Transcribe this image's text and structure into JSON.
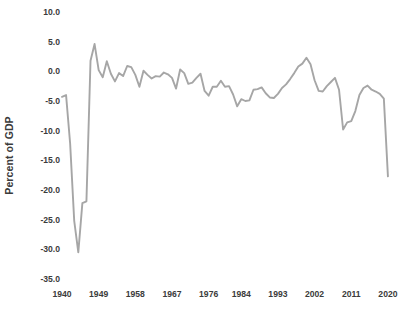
{
  "chart_data": {
    "type": "line",
    "title": "",
    "xlabel": "",
    "ylabel": "Percent of GDP",
    "ylim": [
      -35.0,
      10.0
    ],
    "xlim": [
      1940,
      2021
    ],
    "grid": false,
    "legend": "none",
    "line_color": "#a6a6a6",
    "y_ticks": [
      10.0,
      5.0,
      0.0,
      -5.0,
      -10.0,
      -15.0,
      -20.0,
      -25.0,
      -30.0,
      -35.0
    ],
    "y_tick_labels": [
      "10.0",
      "5.0",
      "0.0",
      "-5.0",
      "-10.0",
      "-15.0",
      "-20.0",
      "-25.0",
      "-30.0",
      "-35.0"
    ],
    "x_ticks": [
      1940,
      1949,
      1958,
      1967,
      1976,
      1984,
      1993,
      2002,
      2011,
      2020
    ],
    "x_tick_labels": [
      "1940",
      "1949",
      "1958",
      "1967",
      "1976",
      "1984",
      "1993",
      "2002",
      "2011",
      "2020"
    ],
    "x": [
      1940,
      1941,
      1942,
      1943,
      1944,
      1945,
      1946,
      1947,
      1948,
      1949,
      1950,
      1951,
      1952,
      1953,
      1954,
      1955,
      1956,
      1957,
      1958,
      1959,
      1960,
      1961,
      1962,
      1963,
      1964,
      1965,
      1966,
      1967,
      1968,
      1969,
      1970,
      1971,
      1972,
      1973,
      1974,
      1975,
      1976,
      1977,
      1978,
      1979,
      1980,
      1981,
      1982,
      1983,
      1984,
      1985,
      1986,
      1987,
      1988,
      1989,
      1990,
      1991,
      1992,
      1993,
      1994,
      1995,
      1996,
      1997,
      1998,
      1999,
      2000,
      2001,
      2002,
      2003,
      2004,
      2005,
      2006,
      2007,
      2008,
      2009,
      2010,
      2011,
      2012,
      2013,
      2014,
      2015,
      2016,
      2017,
      2018,
      2019,
      2020
    ],
    "values": [
      -4.3,
      -4.0,
      -12.2,
      -25.2,
      -30.5,
      -22.2,
      -21.9,
      1.8,
      4.6,
      0.2,
      -1.0,
      1.7,
      -0.4,
      -1.7,
      -0.3,
      -0.8,
      0.9,
      0.7,
      -0.6,
      -2.6,
      0.1,
      -0.6,
      -1.2,
      -0.8,
      -0.9,
      -0.2,
      -0.5,
      -1.1,
      -2.9,
      0.3,
      -0.3,
      -2.1,
      -1.9,
      -1.1,
      -0.4,
      -3.3,
      -4.1,
      -2.6,
      -2.6,
      -1.6,
      -2.6,
      -2.5,
      -3.9,
      -5.9,
      -4.7,
      -5.0,
      -4.9,
      -3.1,
      -3.0,
      -2.7,
      -3.7,
      -4.4,
      -4.5,
      -3.8,
      -2.8,
      -2.2,
      -1.3,
      -0.3,
      0.8,
      1.3,
      2.3,
      1.2,
      -1.5,
      -3.3,
      -3.4,
      -2.5,
      -1.8,
      -1.1,
      -3.1,
      -9.8,
      -8.6,
      -8.4,
      -6.7,
      -4.0,
      -2.8,
      -2.4,
      -3.1,
      -3.4,
      -3.8,
      -4.6,
      -17.7
    ],
    "series_name": "Federal Surplus or Deficit as Percent of GDP"
  }
}
